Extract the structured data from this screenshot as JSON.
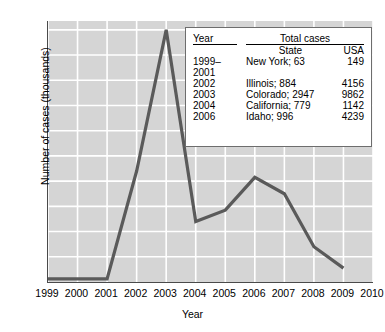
{
  "chart_data": {
    "type": "line",
    "title": "",
    "subtitle": "",
    "xlabel": "Year",
    "ylabel": "Number of cases (thousands)",
    "xlim": [
      1999,
      2010
    ],
    "ylim": [
      0,
      10.35
    ],
    "x_ticks": [
      "1999",
      "2000",
      "2001",
      "2002",
      "2003",
      "2004",
      "2005",
      "2006",
      "2007",
      "2008",
      "2009",
      "2010"
    ],
    "y_ticks": [
      "1",
      "2",
      "3",
      "4",
      "5",
      "6",
      "7",
      "8",
      "9",
      "10"
    ],
    "grid": true,
    "legend_position": "none",
    "plot_bg_color": "#d5d5d5",
    "grid_color": "#ffffff",
    "line_color": "#5a5a5a",
    "series": [
      {
        "name": "Number of cases (thousands)",
        "x": [
          1999,
          2000,
          2001,
          2002,
          2003,
          2004,
          2005,
          2006,
          2007,
          2008,
          2009
        ],
        "values": [
          0.12,
          0.12,
          0.12,
          4.4,
          10.0,
          2.4,
          2.85,
          4.15,
          3.5,
          1.4,
          0.55
        ]
      }
    ]
  },
  "axes": {
    "y_title": "Number of cases (thousands)",
    "x_title": "Year",
    "y_tick_labels": [
      "10",
      "9",
      "8",
      "7",
      "6",
      "5",
      "4",
      "3",
      "2",
      "1"
    ],
    "x_tick_labels": [
      "1999",
      "2000",
      "2001",
      "2002",
      "2003",
      "2004",
      "2005",
      "2006",
      "2007",
      "2008",
      "2009",
      "2010"
    ]
  },
  "inset_table": {
    "header_year": "Year",
    "header_total": "Total cases",
    "subheader_state": "State",
    "subheader_usa": "USA",
    "rows": [
      {
        "year": "1999–\n2001",
        "state": "New York; 63",
        "usa": "149"
      },
      {
        "year": "2002",
        "state": "Illinois; 884",
        "usa": "4156"
      },
      {
        "year": "2003",
        "state": "Colorado; 2947",
        "usa": "9862"
      },
      {
        "year": "2004",
        "state": "California; 779",
        "usa": "1142"
      },
      {
        "year": "2006",
        "state": "Idaho; 996",
        "usa": "4239"
      }
    ]
  }
}
